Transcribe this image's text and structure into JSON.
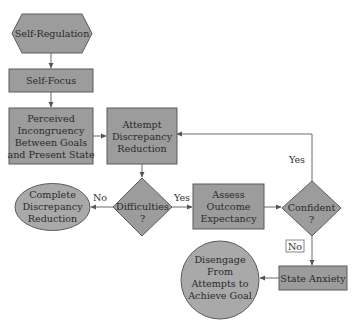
{
  "diagram": {
    "type": "flowchart",
    "nodes": {
      "self_regulation": {
        "shape": "hexagon",
        "lines": [
          "Self-Regulation"
        ]
      },
      "self_focus": {
        "shape": "rectangle",
        "lines": [
          "Self-Focus"
        ]
      },
      "perceived": {
        "shape": "rectangle",
        "lines": [
          "Perceived",
          "Incongruency",
          "Between Goals",
          "and Present State"
        ]
      },
      "attempt": {
        "shape": "rectangle",
        "lines": [
          "Attempt",
          "Discrepancy",
          "Reduction"
        ]
      },
      "difficulties": {
        "shape": "diamond",
        "lines": [
          "Difficulties",
          "?"
        ]
      },
      "complete": {
        "shape": "ellipse",
        "lines": [
          "Complete",
          "Discrepancy",
          "Reduction"
        ]
      },
      "assess": {
        "shape": "rectangle",
        "lines": [
          "Assess",
          "Outcome",
          "Expectancy"
        ]
      },
      "confident": {
        "shape": "diamond",
        "lines": [
          "Confident",
          "?"
        ]
      },
      "state_anxiety": {
        "shape": "rectangle",
        "lines": [
          "State Anxiety"
        ]
      },
      "disengage": {
        "shape": "circle",
        "lines": [
          "Disengage",
          "From",
          "Attempts to",
          "Achieve Goal"
        ]
      }
    },
    "edges": [
      {
        "from": "Self-Regulation",
        "to": "Self-Focus",
        "label": ""
      },
      {
        "from": "Self-Focus",
        "to": "Perceived Incongruency Between Goals and Present State",
        "label": ""
      },
      {
        "from": "Perceived Incongruency Between Goals and Present State",
        "to": "Attempt Discrepancy Reduction",
        "label": ""
      },
      {
        "from": "Attempt Discrepancy Reduction",
        "to": "Difficulties ?",
        "label": ""
      },
      {
        "from": "Difficulties ?",
        "to": "Complete Discrepancy Reduction",
        "label": "No"
      },
      {
        "from": "Difficulties ?",
        "to": "Assess Outcome Expectancy",
        "label": "Yes"
      },
      {
        "from": "Assess Outcome Expectancy",
        "to": "Confident ?",
        "label": ""
      },
      {
        "from": "Confident ?",
        "to": "Attempt Discrepancy Reduction",
        "label": "Yes"
      },
      {
        "from": "Confident ?",
        "to": "State Anxiety",
        "label": "No"
      },
      {
        "from": "State Anxiety",
        "to": "Disengage From Attempts to Achieve Goal",
        "label": ""
      }
    ],
    "edge_labels": {
      "difficulties_no": "No",
      "difficulties_yes": "Yes",
      "confident_yes": "Yes",
      "confident_no": "No"
    },
    "colors": {
      "node_fill": "#9c9c9c",
      "terminal_fill": "#a9a9a9",
      "stroke": "#5a5a5a",
      "edge": "#6a6a6a",
      "text": "#2a2a2a"
    }
  }
}
